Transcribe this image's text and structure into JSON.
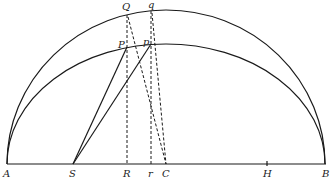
{
  "figure": {
    "type": "geometric-diagram",
    "colors": {
      "ink": "#1a1a1a",
      "background": "#ffffff"
    }
  },
  "labels": {
    "A": "A",
    "S": "S",
    "R": "R",
    "r": "r",
    "C": "C",
    "H": "H",
    "B": "B",
    "Q": "Q",
    "q": "q",
    "P": "P",
    "p": "p"
  },
  "points": {
    "A": [
      7,
      164
    ],
    "B": [
      326,
      164
    ],
    "C": [
      166,
      164
    ],
    "S": [
      73,
      164
    ],
    "R": [
      127,
      164
    ],
    "r": [
      151,
      164
    ],
    "H": [
      267,
      164
    ],
    "Q": [
      127,
      15
    ],
    "q": [
      151,
      11
    ],
    "P": [
      127,
      47
    ],
    "p": [
      151,
      44
    ]
  },
  "curves": {
    "outer_semicircle": {
      "center": [
        166,
        164
      ],
      "rx": 159,
      "ry": 154
    },
    "inner_semiellipse": {
      "center": [
        166,
        164
      ],
      "rx": 159,
      "ry": 120
    }
  },
  "segments": {
    "solid": [
      [
        "A",
        "B"
      ],
      [
        "S",
        "P"
      ],
      [
        "S",
        "p"
      ]
    ],
    "dashed": [
      [
        "Q",
        "R"
      ],
      [
        "q",
        "r"
      ],
      [
        "Q",
        "C"
      ],
      [
        "q",
        "C"
      ]
    ]
  }
}
